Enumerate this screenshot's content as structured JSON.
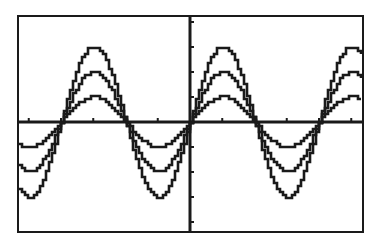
{
  "chart_data": {
    "type": "line",
    "title": "",
    "xlabel": "",
    "ylabel": "",
    "xlim": [
      -8.4,
      8.4
    ],
    "ylim": [
      -4.4,
      4.2
    ],
    "grid": false,
    "legend": null,
    "x_tick_step": 1.5708,
    "y_tick_step": 1,
    "series": [
      {
        "name": "y1 = 3 sin(x)",
        "amplitude": 3,
        "period": 6.2832,
        "phase": 0
      },
      {
        "name": "y2 = 2 sin(x)",
        "amplitude": 2,
        "period": 6.2832,
        "phase": 0
      },
      {
        "name": "y3 = sin(x)",
        "amplitude": 1,
        "period": 6.2832,
        "phase": 0
      }
    ],
    "x_zero_crossings": [
      -6.2832,
      -3.1416,
      0,
      3.1416,
      6.2832
    ],
    "peaks_x": [
      -4.7124,
      1.5708,
      7.854
    ],
    "troughs_x": [
      -7.854,
      -1.5708,
      4.7124
    ]
  },
  "display": {
    "frame_color": "#1a1a1a",
    "curve_color": "#1a1a1a",
    "background": "#ffffff"
  }
}
